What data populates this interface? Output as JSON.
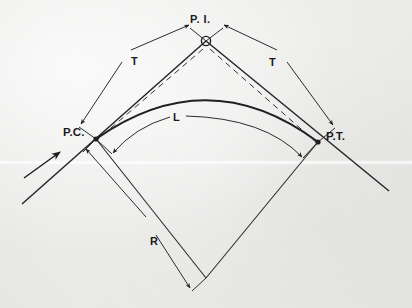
{
  "figure": {
    "kind": "engineering-diagram",
    "background_color": "#efefed",
    "ink_color": "#1f1f1f",
    "width": 412,
    "height": 308
  },
  "labels": {
    "pi": "P. I.",
    "pc": "P.C.",
    "pt": "P.T.",
    "tangent_left": "T",
    "tangent_right": "T",
    "arc_length": "L",
    "radius": "R"
  },
  "label_meanings": {
    "pi": "Point of Intersection",
    "pc": "Point of Curvature",
    "pt": "Point of Tangency",
    "tangent_left": "Tangent distance",
    "tangent_right": "Tangent distance",
    "arc_length": "Length of curve",
    "radius": "Radius of curve"
  },
  "geometry": {
    "pi_point": [
      206,
      41
    ],
    "pc_point": [
      96,
      139
    ],
    "pt_point": [
      318,
      142
    ],
    "center_point": [
      206,
      278
    ],
    "tangent_in_start": [
      22,
      204
    ],
    "tangent_out_end": [
      389,
      191
    ],
    "curve_apex": [
      208,
      102
    ],
    "arc_inner_apex": [
      208,
      117
    ],
    "direction_arrow": {
      "from": [
        26,
        177
      ],
      "to": [
        60,
        152
      ]
    }
  },
  "elements": {
    "main_curve": "bold circular arc from P.C. to P.T.",
    "inner_arc": "thin arc dimension line for L",
    "chords": "dashed lines from P.I. to P.C. and P.I. to P.T.",
    "radii": "two thin lines from P.C. and P.T. to the center point",
    "tangent_dimension_left": "arrowed dimension line parallel to left tangent",
    "tangent_dimension_right": "arrowed dimension line parallel to right tangent",
    "radius_dimension": "arrowed dimension line parallel to left radius"
  }
}
